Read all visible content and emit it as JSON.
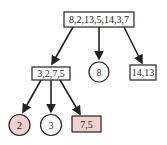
{
  "diagram": {
    "type": "tree",
    "colors": {
      "stroke": "#222222",
      "highlight_fill": "#f0d0d0",
      "default_fill": "#ffffff"
    },
    "nodes": [
      {
        "id": "root",
        "label": "8,2,13,5,14,3,7",
        "shape": "rect",
        "highlighted": false
      },
      {
        "id": "left",
        "label": "3,2,7,5",
        "shape": "rect",
        "highlighted": false
      },
      {
        "id": "middle",
        "label": "8",
        "shape": "circle",
        "highlighted": false
      },
      {
        "id": "right",
        "label": "14,13",
        "shape": "rect",
        "highlighted": false
      },
      {
        "id": "left-left",
        "label": "2",
        "shape": "circle",
        "highlighted": true
      },
      {
        "id": "left-middle",
        "label": "3",
        "shape": "circle",
        "highlighted": false
      },
      {
        "id": "left-right",
        "label": "7,5",
        "shape": "rect",
        "highlighted": true
      }
    ],
    "edges": [
      {
        "from": "root",
        "to": "left"
      },
      {
        "from": "root",
        "to": "middle"
      },
      {
        "from": "root",
        "to": "right"
      },
      {
        "from": "left",
        "to": "left-left"
      },
      {
        "from": "left",
        "to": "left-middle"
      },
      {
        "from": "left",
        "to": "left-right"
      }
    ]
  }
}
